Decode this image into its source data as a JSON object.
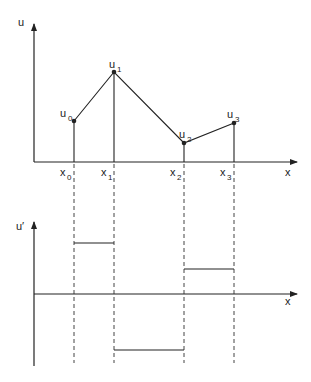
{
  "diagram": {
    "top_plot": {
      "y_axis_label": "u",
      "x_axis_label": "x",
      "nodes": [
        {
          "x_label": "x",
          "x_sub": "0",
          "u_label": "u",
          "u_sub": "0",
          "px": 74,
          "py": 121
        },
        {
          "x_label": "x",
          "x_sub": "1",
          "u_label": "u",
          "u_sub": "1",
          "px": 114,
          "py": 72
        },
        {
          "x_label": "x",
          "x_sub": "2",
          "u_label": "u",
          "u_sub": "2",
          "px": 184,
          "py": 143
        },
        {
          "x_label": "x",
          "x_sub": "3",
          "u_label": "u",
          "u_sub": "3",
          "px": 234,
          "py": 123
        }
      ]
    },
    "bottom_plot": {
      "y_axis_label": "u′",
      "x_axis_label": "x",
      "segments": [
        {
          "from": "x0",
          "to": "x1",
          "py": 243
        },
        {
          "from": "x1",
          "to": "x2",
          "py": 350
        },
        {
          "from": "x2",
          "to": "x3",
          "py": 269
        }
      ]
    },
    "colors": {
      "line": "#222222",
      "dash": "#444444",
      "background": "#ffffff"
    }
  }
}
